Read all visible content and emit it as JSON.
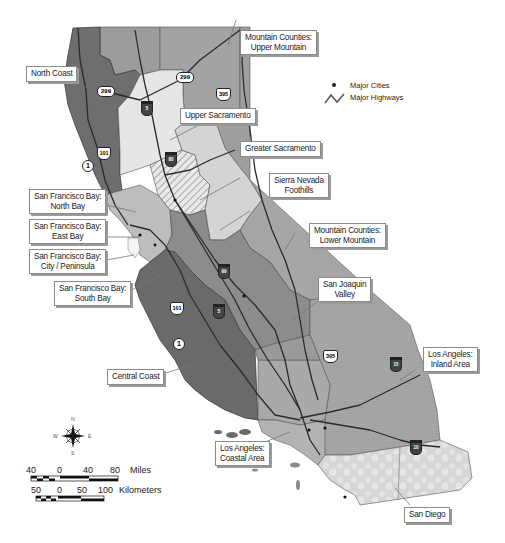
{
  "map": {
    "title": "California Regions",
    "colors": {
      "north_coast": "#6e6e6e",
      "upper_mountain": "#9c9c9c",
      "upper_sacramento": "#e6e6e6",
      "greater_sacramento_hatch": "#c8c8c8",
      "sierra_foothills": "#d4d4d4",
      "lower_mountain": "#a6a6a6",
      "bay_area": "#bdbdbd",
      "central_coast": "#6a6a6a",
      "san_joaquin": "#8c8c8c",
      "la_coastal": "#b3b3b3",
      "la_inland": "#a0a0a0",
      "san_diego": "#d8d8d8",
      "highway": "#2b2b2b",
      "border": "#3a3a3a"
    }
  },
  "regions": [
    {
      "id": "north-coast",
      "label_lines": [
        "North Coast"
      ]
    },
    {
      "id": "upper-mountain",
      "label_lines": [
        "Mountain Counties:",
        "Upper Mountain"
      ]
    },
    {
      "id": "upper-sacramento",
      "label_lines": [
        "Upper Sacramento"
      ]
    },
    {
      "id": "greater-sacramento",
      "label_lines": [
        "Greater Sacramento"
      ]
    },
    {
      "id": "sierra-nevada-foothills",
      "label_lines": [
        "Sierra Nevada",
        "Foothills"
      ]
    },
    {
      "id": "sf-north-bay",
      "label_lines": [
        "San Francisco Bay:",
        "North Bay"
      ]
    },
    {
      "id": "sf-east-bay",
      "label_lines": [
        "San Francisco Bay:",
        "East Bay"
      ]
    },
    {
      "id": "sf-city-peninsula",
      "label_lines": [
        "San Francisco Bay:",
        "City / Peninsula"
      ]
    },
    {
      "id": "sf-south-bay",
      "label_lines": [
        "San Francisco Bay:",
        "South Bay"
      ]
    },
    {
      "id": "lower-mountain",
      "label_lines": [
        "Mountain Counties:",
        "Lower Mountain"
      ]
    },
    {
      "id": "san-joaquin-valley",
      "label_lines": [
        "San Joaquin",
        "Valley"
      ]
    },
    {
      "id": "central-coast",
      "label_lines": [
        "Central Coast"
      ]
    },
    {
      "id": "la-inland",
      "label_lines": [
        "Los Angeles:",
        "Inland Area"
      ]
    },
    {
      "id": "la-coastal",
      "label_lines": [
        "Los Angeles:",
        "Coastal Area"
      ]
    },
    {
      "id": "san-diego",
      "label_lines": [
        "San Diego"
      ]
    }
  ],
  "highways": [
    {
      "id": "ca-299-west",
      "number": "299",
      "type": "state"
    },
    {
      "id": "ca-299-east",
      "number": "299",
      "type": "state"
    },
    {
      "id": "i-5-north",
      "number": "5",
      "type": "interstate"
    },
    {
      "id": "us-395-north",
      "number": "395",
      "type": "us"
    },
    {
      "id": "us-101-north",
      "number": "101",
      "type": "us"
    },
    {
      "id": "ca-1-north",
      "number": "1",
      "type": "state"
    },
    {
      "id": "i-80",
      "number": "80",
      "type": "interstate"
    },
    {
      "id": "i-99",
      "number": "99",
      "type": "interstate"
    },
    {
      "id": "i-5-south",
      "number": "5",
      "type": "interstate"
    },
    {
      "id": "us-101-south",
      "number": "101",
      "type": "us"
    },
    {
      "id": "ca-1-south",
      "number": "1",
      "type": "state"
    },
    {
      "id": "us-395-south",
      "number": "395",
      "type": "us"
    },
    {
      "id": "i-15",
      "number": "15",
      "type": "interstate"
    },
    {
      "id": "i-10",
      "number": "10",
      "type": "interstate"
    }
  ],
  "legend": {
    "cities_label": "Major Cities",
    "highways_label": "Major Highways"
  },
  "compass": {
    "n": "N",
    "s": "S",
    "e": "E",
    "w": "W"
  },
  "scale": {
    "miles": {
      "ticks": [
        "40",
        "0",
        "40",
        "80"
      ],
      "unit": "Miles"
    },
    "km": {
      "ticks": [
        "50",
        "0",
        "50",
        "100"
      ],
      "unit": "Kilometers"
    }
  }
}
